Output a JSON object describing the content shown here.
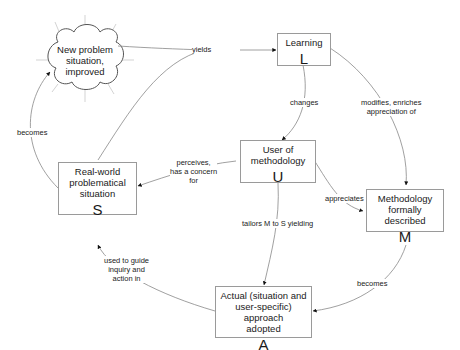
{
  "diagram": {
    "nodes": {
      "new_problem": {
        "title": "New problem situation, improved",
        "lines": [
          "New problem",
          "situation,",
          "improved"
        ]
      },
      "learning": {
        "title": "Learning",
        "letter": "L"
      },
      "user": {
        "title": "User of methodology",
        "lines": [
          "User of",
          "methodology"
        ],
        "letter": "U"
      },
      "real_world": {
        "title": "Real-world problematical situation",
        "lines": [
          "Real-world",
          "problematical",
          "situation"
        ],
        "letter": "S"
      },
      "methodology": {
        "title": "Methodology formally described",
        "lines": [
          "Methodology",
          "formally described"
        ],
        "letter": "M"
      },
      "actual": {
        "title": "Actual (situation and user-specific) approach adopted",
        "lines": [
          "Actual (situation and",
          "user-specific) approach",
          "adopted"
        ],
        "letter": "A"
      }
    },
    "edges": [
      {
        "id": "yields",
        "from": "real_world",
        "to": "learning",
        "label_lines": [
          "yields"
        ]
      },
      {
        "id": "becomes-s-n",
        "from": "real_world",
        "to": "new_problem",
        "label_lines": [
          "becomes"
        ]
      },
      {
        "id": "changes",
        "from": "learning",
        "to": "user",
        "label_lines": [
          "changes"
        ]
      },
      {
        "id": "modifies",
        "from": "learning",
        "to": "methodology",
        "label_lines": [
          "modifies, enriches",
          "appreciation of"
        ]
      },
      {
        "id": "perceives",
        "from": "user",
        "to": "real_world",
        "label_lines": [
          "perceives,",
          "has a concern",
          "for"
        ]
      },
      {
        "id": "appreciates",
        "from": "user",
        "to": "methodology",
        "label_lines": [
          "appreciates"
        ]
      },
      {
        "id": "tailors",
        "from": "user",
        "to": "actual",
        "label_lines": [
          "tailors M to S yielding"
        ]
      },
      {
        "id": "becomes-m-a",
        "from": "methodology",
        "to": "actual",
        "label_lines": [
          "becomes"
        ]
      },
      {
        "id": "used-to-guide",
        "from": "actual",
        "to": "real_world",
        "label_lines": [
          "used to guide",
          "inquiry and",
          "action in"
        ]
      }
    ]
  }
}
